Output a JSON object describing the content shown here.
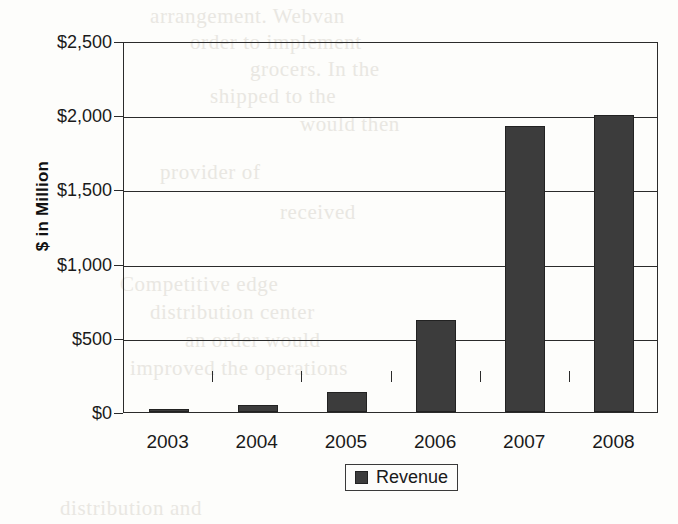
{
  "chart_data": {
    "type": "bar",
    "title": "",
    "xlabel": "",
    "ylabel": "$ in Million",
    "categories": [
      "2003",
      "2004",
      "2005",
      "2006",
      "2007",
      "2008"
    ],
    "values": [
      20,
      45,
      135,
      620,
      1930,
      2000
    ],
    "series": [
      {
        "name": "Revenue",
        "values": [
          20,
          45,
          135,
          620,
          1930,
          2000
        ]
      }
    ],
    "ylim": [
      0,
      2500
    ],
    "ytick_values": [
      0,
      500,
      1000,
      1500,
      2000,
      2500
    ],
    "ytick_labels": [
      "$0",
      "$500",
      "$1,000",
      "$1,500",
      "$2,000",
      "$2,500"
    ],
    "grid": true,
    "legend": {
      "position": "bottom",
      "entries": [
        "Revenue"
      ]
    },
    "bar_color": "#3c3c3c",
    "axis_color": "#2b2b2b"
  },
  "legend": {
    "label": "Revenue",
    "swatch_name": "revenue-color-swatch"
  },
  "background_bleed": [
    {
      "text": "arrangement. Webvan",
      "x": 150,
      "y": 4
    },
    {
      "text": "order to implement",
      "x": 190,
      "y": 30
    },
    {
      "text": "grocers. In the",
      "x": 250,
      "y": 57
    },
    {
      "text": "shipped to the",
      "x": 210,
      "y": 84
    },
    {
      "text": "would then",
      "x": 300,
      "y": 112
    },
    {
      "text": "provider of",
      "x": 160,
      "y": 160
    },
    {
      "text": "received",
      "x": 280,
      "y": 200
    },
    {
      "text": "Competitive edge",
      "x": 120,
      "y": 272
    },
    {
      "text": "distribution center",
      "x": 150,
      "y": 300
    },
    {
      "text": "an order would",
      "x": 185,
      "y": 328
    },
    {
      "text": "improved the operations",
      "x": 130,
      "y": 356
    },
    {
      "text": "distribution and",
      "x": 60,
      "y": 496
    }
  ]
}
